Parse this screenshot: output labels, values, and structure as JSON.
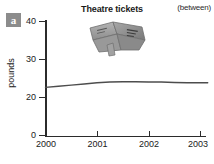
{
  "panel": {
    "letter": "a"
  },
  "header": {
    "title": "Theatre tickets",
    "note": "(between)"
  },
  "clipart": {
    "name": "theatre-tickets-clipart"
  },
  "chart_data": {
    "type": "line",
    "title": "Theatre tickets",
    "annotation": "(between)",
    "xlabel": "",
    "ylabel": "pounds",
    "xlim": [
      2000,
      2003.15
    ],
    "ylim": [
      0,
      41
    ],
    "grid": false,
    "legend": null,
    "x_ticks": [
      "2000",
      "2001",
      "2002",
      "2003"
    ],
    "x_tick_values": [
      2000,
      2001,
      2002,
      2003
    ],
    "y_ticks": [
      "0",
      "20",
      "30",
      "40"
    ],
    "y_tick_values": [
      0,
      20,
      30,
      40
    ],
    "series": [
      {
        "name": "Theatre tickets",
        "color": "#4d4d4d",
        "x": [
          2000.0,
          2000.25,
          2000.5,
          2000.75,
          2001.0,
          2001.25,
          2001.5,
          2001.75,
          2002.0,
          2002.25,
          2002.5,
          2002.75,
          2003.0,
          2003.15
        ],
        "values": [
          22.4,
          22.7,
          23.0,
          23.3,
          23.6,
          23.8,
          23.9,
          23.9,
          23.8,
          23.8,
          23.7,
          23.6,
          23.6,
          23.6
        ]
      }
    ]
  }
}
